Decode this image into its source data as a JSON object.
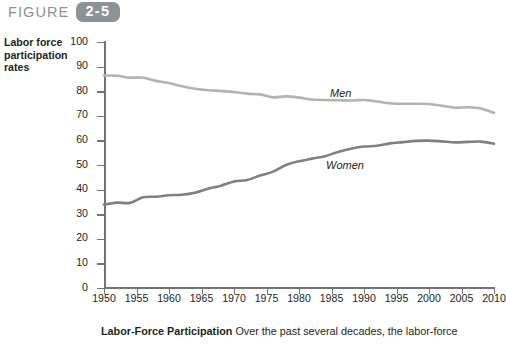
{
  "figure": {
    "word": "FIGURE",
    "number": "2-5"
  },
  "axis_title": "Labor force participation rates",
  "caption": {
    "title": "Labor-Force Participation",
    "text": "Over the past several decades, the labor-force"
  },
  "colors": {
    "men_line": "#b3b3b3",
    "women_line": "#808080",
    "axis": "#6f7478",
    "badge": "#8d9296",
    "text": "#231f20"
  },
  "chart_data": {
    "type": "line",
    "title": "",
    "xlabel": "Year",
    "ylabel": "Labor force participation rates",
    "xlim": [
      1950,
      2010
    ],
    "ylim": [
      0,
      100
    ],
    "xticks": [
      1950,
      1955,
      1960,
      1965,
      1970,
      1975,
      1980,
      1985,
      1990,
      1995,
      2000,
      2005,
      2010
    ],
    "yticks": [
      0,
      10,
      20,
      30,
      40,
      50,
      60,
      70,
      80,
      90,
      100
    ],
    "grid": false,
    "legend_position": "inline-labels",
    "x": [
      1950,
      1952,
      1954,
      1956,
      1958,
      1960,
      1962,
      1964,
      1966,
      1968,
      1970,
      1972,
      1974,
      1976,
      1978,
      1980,
      1982,
      1984,
      1986,
      1988,
      1990,
      1992,
      1994,
      1996,
      1998,
      2000,
      2002,
      2004,
      2006,
      2008,
      2010
    ],
    "series": [
      {
        "name": "Men",
        "color": "#b3b3b3",
        "values": [
          86.4,
          86.3,
          85.5,
          85.5,
          84.2,
          83.3,
          82.0,
          81.0,
          80.4,
          80.1,
          79.7,
          79.0,
          78.7,
          77.5,
          77.9,
          77.4,
          76.6,
          76.4,
          76.3,
          76.2,
          76.4,
          75.8,
          75.1,
          74.9,
          74.9,
          74.8,
          74.1,
          73.3,
          73.5,
          73.0,
          71.2
        ]
      },
      {
        "name": "Women",
        "color": "#808080",
        "values": [
          33.9,
          34.7,
          34.6,
          36.9,
          37.1,
          37.7,
          37.9,
          38.7,
          40.3,
          41.6,
          43.3,
          43.9,
          45.7,
          47.3,
          50.0,
          51.5,
          52.6,
          53.6,
          55.3,
          56.6,
          57.5,
          57.8,
          58.8,
          59.3,
          59.8,
          59.9,
          59.6,
          59.2,
          59.4,
          59.5,
          58.6
        ]
      }
    ]
  }
}
